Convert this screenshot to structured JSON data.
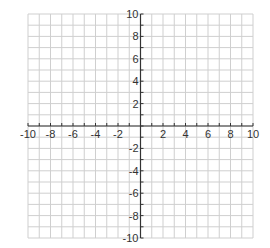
{
  "chart_data": {
    "type": "scatter",
    "title": "",
    "xlabel": "",
    "ylabel": "",
    "xlim": [
      -10,
      10
    ],
    "ylim": [
      -10,
      10
    ],
    "grid": true,
    "grid_step": 1,
    "series": [],
    "x_tick_labels": [
      "-10",
      "-8",
      "-6",
      "-4",
      "-2",
      "2",
      "4",
      "6",
      "8",
      "10"
    ],
    "y_tick_labels": [
      "10",
      "8",
      "6",
      "4",
      "2",
      "-2",
      "-4",
      "-6",
      "-8",
      "-10"
    ],
    "x_ticks": [
      -10,
      -8,
      -6,
      -4,
      -2,
      2,
      4,
      6,
      8,
      10
    ],
    "y_ticks": [
      10,
      8,
      6,
      4,
      2,
      -2,
      -4,
      -6,
      -8,
      -10
    ]
  },
  "colors": {
    "grid": "#cfcfcf",
    "axis": "#333333",
    "label": "#333333",
    "background": "#ffffff"
  }
}
